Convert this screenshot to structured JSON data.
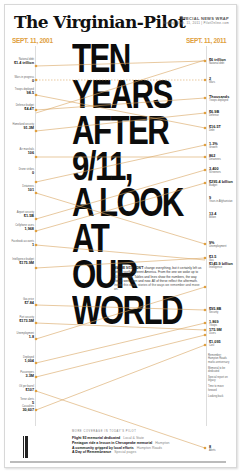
{
  "masthead": {
    "title": "The Virginian-Pilot",
    "tag": "SPECIAL NEWS WRAP",
    "tag_sub": "Sunday, Sept. 11, 2011 | PilotOnline.com"
  },
  "dates": {
    "left": "SEPT. 11, 2001",
    "right": "SEPT. 11, 2011"
  },
  "headline": {
    "lines": [
      "TEN",
      "YEARS",
      "AFTER",
      "9/11,",
      "A LOOK",
      "AT",
      "OUR",
      "WORLD"
    ]
  },
  "intro": {
    "lead": "MAYBE 9/11 DIDN'T",
    "body": "change everything, but it certainly left us with a vastly different America. From the one we woke up to 10 years ago. Tables and lines show the numbers, the way things were then and now. All of these reflect the aftermath.",
    "credit": "Inside this wrap: stories of the ways we remember and move on."
  },
  "left_stats": [
    {
      "value": "$1.4 trillion",
      "label": "National debt"
    },
    {
      "value": "0",
      "label": "Wars in progress"
    },
    {
      "value": "98.5",
      "label": "Troops deployed"
    },
    {
      "value": "$4.4T",
      "label": "Defense budget"
    },
    {
      "value": "91.3M",
      "label": "Homeland security"
    },
    {
      "value": "106",
      "label": "Air marshals"
    },
    {
      "value": "0",
      "label": "Drone strikes"
    },
    {
      "value": "101",
      "label": "Detainees"
    },
    {
      "value": "$1.5B",
      "label": "Airport security"
    },
    {
      "value": "1,968",
      "label": "Cellphone users"
    },
    {
      "value": "1",
      "label": "Facebook accounts"
    },
    {
      "value": "$175.9M",
      "label": "Intelligence budget"
    },
    {
      "value": "$7.84",
      "label": "Gas price"
    },
    {
      "value": "$173.5M",
      "label": "Port security"
    },
    {
      "value": "1.8",
      "label": "Unemployment"
    },
    {
      "value": "1,004",
      "label": "Deployed"
    },
    {
      "value": "3.3M",
      "label": "Passengers"
    },
    {
      "value": "$107",
      "label": "Oil per barrel"
    },
    {
      "value": "5",
      "label": "Terror alerts"
    },
    {
      "value": "30,607",
      "label": "Casualties"
    }
  ],
  "right_stats": [
    {
      "value": "$6 trillion",
      "label": "National debt"
    },
    {
      "value": "2",
      "label": "Wars"
    },
    {
      "value": "Thousands",
      "label": "Troops deployed"
    },
    {
      "value": "$6.9B",
      "label": "Defense"
    },
    {
      "value": "$16.5T",
      "label": "Debt"
    },
    {
      "value": "1.3%",
      "label": "Growth"
    },
    {
      "value": "862",
      "label": "Detainees"
    },
    {
      "value": "3,400",
      "label": "Screeners"
    },
    {
      "value": "$295.4 billion",
      "label": "Budget"
    },
    {
      "value": "9",
      "label": "Years in Afghanistan"
    },
    {
      "value": "13.4",
      "label": "Billion"
    },
    {
      "value": "9%",
      "label": "Unemployment"
    },
    {
      "value": "$3.5",
      "label": "Gas"
    },
    {
      "value": "$145.9 billion",
      "label": "Intelligence"
    },
    {
      "value": "$95.8B",
      "label": "Security"
    },
    {
      "value": "1,869",
      "label": "Troops"
    },
    {
      "value": "175.9M",
      "label": "Users"
    },
    {
      "value": "$1,095",
      "label": "Cost"
    },
    {
      "value": "8",
      "label": "Alerts"
    }
  ],
  "sidebar": [
    "Remember: Hampton Roads marks anniversary",
    "Memorial to be dedicated",
    "Special report on legacy",
    "Time to move forward",
    "Looking back"
  ],
  "inside": {
    "heading": "MORE COVERAGE IN TODAY'S PILOT",
    "items": [
      {
        "title": "Flight 93 memorial dedicated",
        "section": "Local & State"
      },
      {
        "title": "Pentagon ride a lesson in Chesapeake memorial",
        "section": "Hampton"
      },
      {
        "title": "A community gripped by local efforts",
        "section": "Hampton Roads"
      },
      {
        "title": "A Day of Remembrance",
        "section": "Special pages"
      }
    ]
  },
  "colors": {
    "accent": "#e0a040",
    "line": "#d9a460",
    "headline": "#0c0c0c"
  }
}
